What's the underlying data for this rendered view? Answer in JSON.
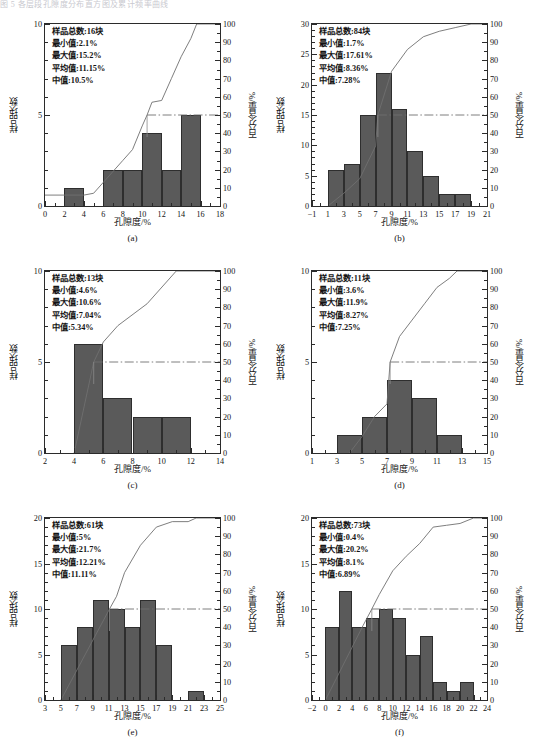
{
  "topstrip": "图 5 各层段孔隙度分布直方图及累计频率曲线",
  "labels": {
    "xaxis_title": "孔隙度/%",
    "yaxis_title": "样品块数",
    "raxis_title": "百分含量/%",
    "stat_total": "样品总数",
    "stat_min": "最小值",
    "stat_max": "最大值",
    "stat_mean": "平均值",
    "stat_median": "中值",
    "unit_block": "块"
  },
  "chart_data": [
    {
      "id": "a",
      "type": "bar",
      "caption": "(a)",
      "title": "",
      "xlabel": "孔隙度/%",
      "ylabel": "样品块数",
      "rlabel": "百分含量/%",
      "xlim": [
        0,
        18
      ],
      "xticks": [
        0,
        2,
        4,
        6,
        8,
        10,
        12,
        14,
        16,
        18
      ],
      "ylim": [
        0,
        10
      ],
      "yticks": [
        0,
        5,
        10
      ],
      "rlim": [
        0,
        100
      ],
      "rticks": [
        0,
        10,
        20,
        30,
        40,
        50,
        60,
        70,
        80,
        90,
        100
      ],
      "bin_width": 2,
      "bins": [
        {
          "x0": 2,
          "x1": 4,
          "count": 1
        },
        {
          "x0": 6,
          "x1": 8,
          "count": 2
        },
        {
          "x0": 8,
          "x1": 10,
          "count": 2
        },
        {
          "x0": 10,
          "x1": 12,
          "count": 4
        },
        {
          "x0": 12,
          "x1": 14,
          "count": 2
        },
        {
          "x0": 14,
          "x1": 16,
          "count": 5
        }
      ],
      "cumulative": [
        {
          "x": 0,
          "y": 6
        },
        {
          "x": 4,
          "y": 6
        },
        {
          "x": 5,
          "y": 7
        },
        {
          "x": 6,
          "y": 13
        },
        {
          "x": 8,
          "y": 25
        },
        {
          "x": 9,
          "y": 31
        },
        {
          "x": 10,
          "y": 44
        },
        {
          "x": 10.5,
          "y": 50
        },
        {
          "x": 11,
          "y": 57
        },
        {
          "x": 12,
          "y": 58
        },
        {
          "x": 13,
          "y": 70
        },
        {
          "x": 14,
          "y": 82
        },
        {
          "x": 15,
          "y": 92
        },
        {
          "x": 15.6,
          "y": 100
        },
        {
          "x": 18,
          "y": 100
        }
      ],
      "median_marker": {
        "x": 10.5,
        "y": 50
      },
      "stats": {
        "total": "16",
        "min": "2.1%",
        "max": "15.2%",
        "mean": "11.15%",
        "median": "10.5%"
      },
      "stat_lines": [
        "样品总数:16块",
        "最小值:2.1%",
        "最大值:15.2%",
        "平均值:11.15%",
        "中值:10.5%"
      ]
    },
    {
      "id": "b",
      "type": "bar",
      "caption": "(b)",
      "title": "",
      "xlabel": "孔隙度/%",
      "ylabel": "样品块数",
      "rlabel": "百分含量/%",
      "xlim": [
        -1,
        21
      ],
      "xticks": [
        -1,
        1,
        3,
        5,
        7,
        9,
        11,
        13,
        15,
        17,
        19,
        21
      ],
      "ylim": [
        0,
        30
      ],
      "yticks": [
        0,
        5,
        10,
        15,
        20,
        25,
        30
      ],
      "rlim": [
        0,
        100
      ],
      "rticks": [
        0,
        10,
        20,
        30,
        40,
        50,
        60,
        70,
        80,
        90,
        100
      ],
      "bin_width": 2,
      "bins": [
        {
          "x0": 1,
          "x1": 3,
          "count": 6
        },
        {
          "x0": 3,
          "x1": 5,
          "count": 7
        },
        {
          "x0": 5,
          "x1": 7,
          "count": 15
        },
        {
          "x0": 7,
          "x1": 9,
          "count": 22
        },
        {
          "x0": 9,
          "x1": 11,
          "count": 16
        },
        {
          "x0": 11,
          "x1": 13,
          "count": 9
        },
        {
          "x0": 13,
          "x1": 15,
          "count": 5
        },
        {
          "x0": 15,
          "x1": 17,
          "count": 2
        },
        {
          "x0": 17,
          "x1": 19,
          "count": 2
        }
      ],
      "cumulative": [
        {
          "x": 1,
          "y": 0
        },
        {
          "x": 3,
          "y": 7
        },
        {
          "x": 5,
          "y": 15
        },
        {
          "x": 7,
          "y": 33
        },
        {
          "x": 7.28,
          "y": 50
        },
        {
          "x": 9,
          "y": 74
        },
        {
          "x": 11,
          "y": 86
        },
        {
          "x": 13,
          "y": 93
        },
        {
          "x": 15,
          "y": 96
        },
        {
          "x": 17,
          "y": 98
        },
        {
          "x": 19,
          "y": 100
        },
        {
          "x": 21,
          "y": 100
        }
      ],
      "median_marker": {
        "x": 7.28,
        "y": 50
      },
      "stats": {
        "total": "84",
        "min": "1.7%",
        "max": "17.61%",
        "mean": "8.36%",
        "median": "7.28%"
      },
      "stat_lines": [
        "样品总数:84块",
        "最小值:1.7%",
        "最大值:17.61%",
        "平均值:8.36%",
        "中值:7.28%"
      ]
    },
    {
      "id": "c",
      "type": "bar",
      "caption": "(c)",
      "title": "",
      "xlabel": "孔隙度/%",
      "ylabel": "样品块数",
      "rlabel": "百分含量/%",
      "xlim": [
        2,
        14
      ],
      "xticks": [
        2,
        4,
        6,
        8,
        10,
        12,
        14
      ],
      "ylim": [
        0,
        10
      ],
      "yticks": [
        0,
        5,
        10
      ],
      "rlim": [
        0,
        100
      ],
      "rticks": [
        0,
        10,
        20,
        30,
        40,
        50,
        60,
        70,
        80,
        90,
        100
      ],
      "bin_width": 2,
      "bins": [
        {
          "x0": 4,
          "x1": 6,
          "count": 6
        },
        {
          "x0": 6,
          "x1": 8,
          "count": 3
        },
        {
          "x0": 8,
          "x1": 10,
          "count": 2
        },
        {
          "x0": 10,
          "x1": 12,
          "count": 2
        }
      ],
      "cumulative": [
        {
          "x": 4,
          "y": 0
        },
        {
          "x": 5.34,
          "y": 50
        },
        {
          "x": 6,
          "y": 61
        },
        {
          "x": 7,
          "y": 70
        },
        {
          "x": 9,
          "y": 82
        },
        {
          "x": 11,
          "y": 100
        },
        {
          "x": 14,
          "y": 100
        }
      ],
      "median_marker": {
        "x": 5.34,
        "y": 50
      },
      "stats": {
        "total": "13",
        "min": "4.6%",
        "max": "10.6%",
        "mean": "7.04%",
        "median": "5.34%"
      },
      "stat_lines": [
        "样品总数:13块",
        "最小值:4.6%",
        "最大值:10.6%",
        "平均值:7.04%",
        "中值:5.34%"
      ]
    },
    {
      "id": "d",
      "type": "bar",
      "caption": "(d)",
      "title": "",
      "xlabel": "孔隙度/%",
      "ylabel": "样品块数",
      "rlabel": "百分含量/%",
      "xlim": [
        1,
        15
      ],
      "xticks": [
        1,
        3,
        5,
        7,
        9,
        11,
        13,
        15
      ],
      "ylim": [
        0,
        10
      ],
      "yticks": [
        0,
        5,
        10
      ],
      "rlim": [
        0,
        100
      ],
      "rticks": [
        0,
        10,
        20,
        30,
        40,
        50,
        60,
        70,
        80,
        90,
        100
      ],
      "bin_width": 2,
      "bins": [
        {
          "x0": 3,
          "x1": 5,
          "count": 1
        },
        {
          "x0": 5,
          "x1": 7,
          "count": 2
        },
        {
          "x0": 7,
          "x1": 9,
          "count": 4
        },
        {
          "x0": 9,
          "x1": 11,
          "count": 3
        },
        {
          "x0": 11,
          "x1": 13,
          "count": 1
        }
      ],
      "cumulative": [
        {
          "x": 4,
          "y": 0
        },
        {
          "x": 5,
          "y": 9
        },
        {
          "x": 6,
          "y": 20
        },
        {
          "x": 7,
          "y": 27
        },
        {
          "x": 7.25,
          "y": 50
        },
        {
          "x": 8,
          "y": 64
        },
        {
          "x": 9,
          "y": 73
        },
        {
          "x": 10,
          "y": 82
        },
        {
          "x": 11,
          "y": 91
        },
        {
          "x": 12,
          "y": 96
        },
        {
          "x": 12.6,
          "y": 100
        },
        {
          "x": 15,
          "y": 100
        }
      ],
      "median_marker": {
        "x": 7.25,
        "y": 50
      },
      "stats": {
        "total": "11",
        "min": "3.6%",
        "max": "11.9%",
        "mean": "8.27%",
        "median": "7.25%"
      },
      "stat_lines": [
        "样品总数:11块",
        "最小值:3.6%",
        "最大值:11.9%",
        "平均值:8.27%",
        "中值:7.25%"
      ]
    },
    {
      "id": "e",
      "type": "bar",
      "caption": "(e)",
      "title": "",
      "xlabel": "孔隙度/%",
      "ylabel": "样品块数",
      "rlabel": "百分含量/%",
      "xlim": [
        3,
        25
      ],
      "xticks": [
        3,
        5,
        7,
        9,
        11,
        13,
        15,
        17,
        19,
        21,
        23,
        25
      ],
      "ylim": [
        0,
        20
      ],
      "yticks": [
        0,
        5,
        10,
        15,
        20
      ],
      "rlim": [
        0,
        100
      ],
      "rticks": [
        0,
        10,
        20,
        30,
        40,
        50,
        60,
        70,
        80,
        90,
        100
      ],
      "bin_width": 2,
      "bins": [
        {
          "x0": 5,
          "x1": 7,
          "count": 6
        },
        {
          "x0": 7,
          "x1": 9,
          "count": 8
        },
        {
          "x0": 9,
          "x1": 11,
          "count": 11
        },
        {
          "x0": 11,
          "x1": 13,
          "count": 10
        },
        {
          "x0": 13,
          "x1": 15,
          "count": 8
        },
        {
          "x0": 15,
          "x1": 17,
          "count": 11
        },
        {
          "x0": 17,
          "x1": 19,
          "count": 6
        },
        {
          "x0": 21,
          "x1": 23,
          "count": 1
        }
      ],
      "cumulative": [
        {
          "x": 5,
          "y": 0
        },
        {
          "x": 11.11,
          "y": 50
        },
        {
          "x": 12,
          "y": 57
        },
        {
          "x": 13,
          "y": 70
        },
        {
          "x": 15,
          "y": 85
        },
        {
          "x": 17,
          "y": 95
        },
        {
          "x": 19,
          "y": 98
        },
        {
          "x": 21,
          "y": 98
        },
        {
          "x": 22,
          "y": 100
        },
        {
          "x": 25,
          "y": 100
        }
      ],
      "median_marker": {
        "x": 11.11,
        "y": 50
      },
      "stats": {
        "total": "61",
        "min": "5%",
        "max": "21.7%",
        "mean": "12.21%",
        "median": "11.11%"
      },
      "stat_lines": [
        "样品总数:61块",
        "最小值:5%",
        "最大值:21.7%",
        "平均值:12.21%",
        "中值:11.11%"
      ]
    },
    {
      "id": "f",
      "type": "bar",
      "caption": "(f)",
      "title": "",
      "xlabel": "孔隙度/%",
      "ylabel": "样品块数",
      "rlabel": "百分含量/%",
      "xlim": [
        -2,
        24
      ],
      "xticks": [
        -2,
        0,
        2,
        4,
        6,
        8,
        10,
        12,
        14,
        16,
        18,
        20,
        22,
        24
      ],
      "ylim": [
        0,
        20
      ],
      "yticks": [
        0,
        5,
        10,
        15,
        20
      ],
      "rlim": [
        0,
        100
      ],
      "rticks": [
        0,
        10,
        20,
        30,
        40,
        50,
        60,
        70,
        80,
        90,
        100
      ],
      "bin_width": 2,
      "bins": [
        {
          "x0": 0,
          "x1": 2,
          "count": 8
        },
        {
          "x0": 2,
          "x1": 4,
          "count": 12
        },
        {
          "x0": 4,
          "x1": 6,
          "count": 8
        },
        {
          "x0": 6,
          "x1": 8,
          "count": 9
        },
        {
          "x0": 8,
          "x1": 10,
          "count": 10
        },
        {
          "x0": 10,
          "x1": 12,
          "count": 9
        },
        {
          "x0": 12,
          "x1": 14,
          "count": 5
        },
        {
          "x0": 14,
          "x1": 16,
          "count": 7
        },
        {
          "x0": 16,
          "x1": 18,
          "count": 2
        },
        {
          "x0": 18,
          "x1": 20,
          "count": 1
        },
        {
          "x0": 20,
          "x1": 22,
          "count": 2
        }
      ],
      "cumulative": [
        {
          "x": 0,
          "y": 0
        },
        {
          "x": 5.6,
          "y": 41
        },
        {
          "x": 6.89,
          "y": 50
        },
        {
          "x": 8,
          "y": 58
        },
        {
          "x": 10,
          "y": 71
        },
        {
          "x": 12,
          "y": 79
        },
        {
          "x": 14,
          "y": 86
        },
        {
          "x": 16,
          "y": 95
        },
        {
          "x": 18,
          "y": 96
        },
        {
          "x": 20,
          "y": 97
        },
        {
          "x": 22,
          "y": 100
        },
        {
          "x": 24,
          "y": 100
        }
      ],
      "median_marker": {
        "x": 6.89,
        "y": 50
      },
      "stats": {
        "total": "73",
        "min": "0.4%",
        "max": "20.2%",
        "mean": "8.1%",
        "median": "6.89%"
      },
      "stat_lines": [
        "样品总数:73块",
        "最小值:0.4%",
        "最大值:20.2%",
        "平均值:8.1%",
        "中值:6.89%"
      ]
    }
  ]
}
